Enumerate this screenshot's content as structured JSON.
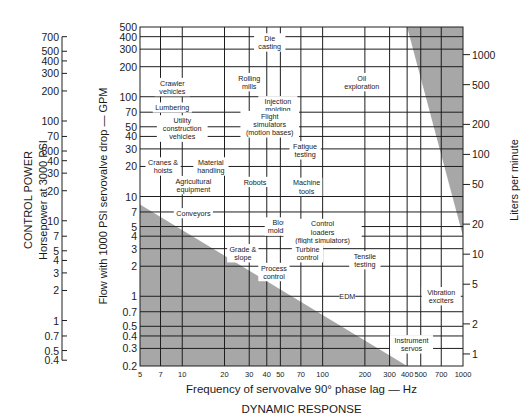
{
  "chart_data": {
    "type": "table",
    "title": "",
    "xlabel": "Frequency of servovalve 90° phase lag — Hz",
    "xlabel_sub": "DYNAMIC RESPONSE",
    "ylabel": "Flow with 1000 PSI servovalve drop — GPM",
    "ylabel_left_outer": "CONTROL POWER",
    "ylabel_left_outer_sub": "Horsepower at 3000 PSI",
    "ylabel_right": "Liters per minute",
    "x_scale": "log",
    "y_scale": "log",
    "xlim": [
      5,
      1000
    ],
    "ylim": [
      0.2,
      500
    ],
    "grid": true,
    "x_ticks": [
      5,
      7,
      10,
      20,
      30,
      40,
      50,
      70,
      100,
      200,
      300,
      400,
      500,
      700,
      1000
    ],
    "y_ticks_gpm": [
      500,
      400,
      300,
      200,
      100,
      70,
      50,
      40,
      30,
      20,
      10,
      7,
      5,
      4,
      3,
      2,
      1,
      0.7,
      0.5,
      0.4,
      0.3,
      0.2
    ],
    "y_ticks_hp_labels": [
      "700",
      "500",
      "400",
      "300",
      "200",
      "100",
      "70",
      "500",
      "40",
      "30",
      "20",
      "10",
      "7",
      "5",
      "4",
      "3",
      "2",
      "1",
      "0.7",
      "0.5",
      "0.4"
    ],
    "y_ticks_hp_values": [
      700,
      500,
      400,
      300,
      200,
      100,
      70,
      50,
      40,
      30,
      20,
      10,
      7,
      5,
      4,
      3,
      2,
      1,
      0.7,
      0.5,
      0.4
    ],
    "y_ticks_lpm": [
      1000,
      500,
      200,
      100,
      50,
      20,
      10,
      5,
      2,
      1
    ],
    "shaded_regions": [
      {
        "name": "infeasible-low-flow-low-frequency",
        "points_hz_gpm": [
          [
            5,
            8.3
          ],
          [
            400,
            0.2
          ],
          [
            5,
            0.2
          ]
        ]
      },
      {
        "name": "infeasible-high-flow-high-frequency",
        "points_hz_gpm": [
          [
            400,
            500
          ],
          [
            1000,
            500
          ],
          [
            1000,
            4.0
          ]
        ]
      }
    ],
    "applications": [
      {
        "label": [
          "Die",
          "casting"
        ],
        "hz": 42,
        "gpm": 350
      },
      {
        "label": [
          "Rolling",
          "mills"
        ],
        "hz": 30,
        "gpm": 140
      },
      {
        "label": [
          "Oil",
          "exploration"
        ],
        "hz": 190,
        "gpm": 140
      },
      {
        "label": [
          "Crawler",
          "vehicles"
        ],
        "hz": 8.5,
        "gpm": 125
      },
      {
        "label": [
          "Lumbering"
        ],
        "hz": 8.5,
        "gpm": 78
      },
      {
        "label": [
          "Injection",
          "molding"
        ],
        "hz": 48,
        "gpm": 82
      },
      {
        "label": [
          "Utility",
          "construction",
          "vehicles"
        ],
        "hz": 10,
        "gpm": 48
      },
      {
        "label": [
          "Flight",
          "simulators",
          "(motion bases)"
        ],
        "hz": 42,
        "gpm": 53
      },
      {
        "label": [
          "Fatigue",
          "testing"
        ],
        "hz": 75,
        "gpm": 29
      },
      {
        "label": [
          "Cranes &",
          "hoists"
        ],
        "hz": 7.3,
        "gpm": 20
      },
      {
        "label": [
          "Material",
          "handling"
        ],
        "hz": 16,
        "gpm": 20
      },
      {
        "label": [
          "Agricultural",
          "equipment"
        ],
        "hz": 12,
        "gpm": 13
      },
      {
        "label": [
          "Robots"
        ],
        "hz": 33,
        "gpm": 14
      },
      {
        "label": [
          "Machine",
          "tools"
        ],
        "hz": 77,
        "gpm": 12.5
      },
      {
        "label": [
          "Conveyors"
        ],
        "hz": 12,
        "gpm": 6.8
      },
      {
        "label": [
          "Blow",
          "molding"
        ],
        "hz": 50,
        "gpm": 5
      },
      {
        "label": [
          "Control",
          "loaders",
          "(flight simulators)"
        ],
        "hz": 100,
        "gpm": 4.4
      },
      {
        "label": [
          "Grade &",
          "slope"
        ],
        "hz": 27,
        "gpm": 2.7
      },
      {
        "label": [
          "Turbine",
          "control"
        ],
        "hz": 78,
        "gpm": 2.7
      },
      {
        "label": [
          "Tensile",
          "testing"
        ],
        "hz": 200,
        "gpm": 2.3
      },
      {
        "label": [
          "Process",
          "control"
        ],
        "hz": 45,
        "gpm": 1.75
      },
      {
        "label": [
          "EDM"
        ],
        "hz": 150,
        "gpm": 1
      },
      {
        "label": [
          "Vibration",
          "exciters"
        ],
        "hz": 700,
        "gpm": 1
      },
      {
        "label": [
          "Instrument",
          "servos"
        ],
        "hz": 430,
        "gpm": 0.33
      }
    ]
  },
  "layout": {
    "plot": {
      "x0": 140,
      "x1": 463,
      "y0": 27,
      "y1": 366
    },
    "shade_color": "#a7a7a7",
    "grid_color": "#1e1e1e",
    "hp_axis_x": 62,
    "lpm_axis_x": 470
  }
}
